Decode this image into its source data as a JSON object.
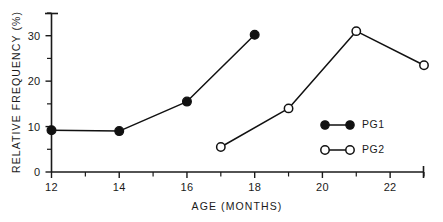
{
  "chart_data": {
    "type": "line",
    "title": "",
    "subtitle": "",
    "xlabel": "AGE (MONTHS)",
    "ylabel": "RELATIVE FREQUENCY (%)",
    "xlim": [
      12,
      23
    ],
    "ylim": [
      0,
      35
    ],
    "grid": false,
    "legend_position": "inside-right",
    "x_tick_labels": [
      "12",
      "14",
      "16",
      "18",
      "20",
      "22"
    ],
    "x_tick_values": [
      12,
      14,
      16,
      18,
      20,
      22
    ],
    "x_minor_ticks": [
      13,
      15,
      17,
      19,
      21,
      23
    ],
    "y_tick_labels": [
      "0",
      "10",
      "20",
      "30"
    ],
    "y_tick_values": [
      0,
      10,
      20,
      30
    ],
    "y_minor_ticks": [
      5,
      15,
      25,
      35
    ],
    "series": [
      {
        "name": "PG1",
        "marker": "filled-circle",
        "x": [
          12,
          14,
          16,
          18
        ],
        "values": [
          9.2,
          9.0,
          15.5,
          30.2
        ]
      },
      {
        "name": "PG2",
        "marker": "open-circle",
        "x": [
          17,
          19,
          21,
          23
        ],
        "values": [
          5.5,
          14.0,
          31.0,
          23.5
        ]
      }
    ]
  },
  "legend": {
    "entries": [
      {
        "label": "PG1",
        "marker": "filled-circle"
      },
      {
        "label": "PG2",
        "marker": "open-circle"
      }
    ]
  },
  "colors": {
    "ink": "#111111",
    "background": "#ffffff"
  }
}
